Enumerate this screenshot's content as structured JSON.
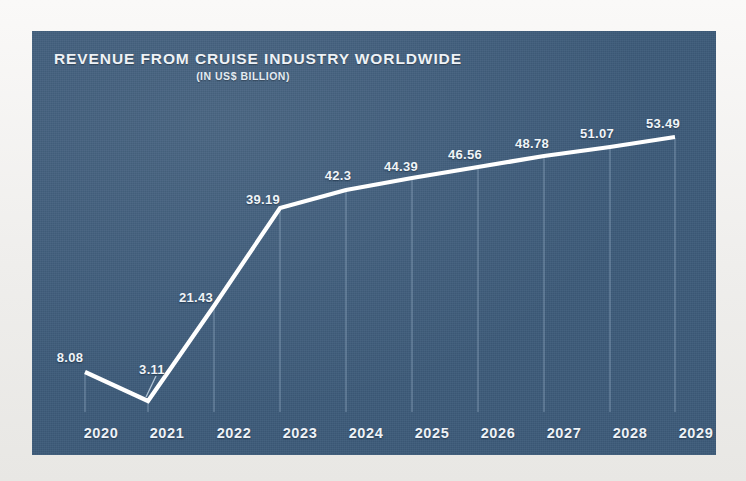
{
  "figure": {
    "background_color": "#f4f3f1",
    "panel_color": "#3c5a79",
    "line_color": "#ffffff",
    "text_color": "#eef2f6",
    "dropline_color": "#9fb6cc"
  },
  "chart_data": {
    "type": "line",
    "title": "REVENUE FROM CRUISE INDUSTRY WORLDWIDE",
    "subtitle": "(IN US$ BILLION)",
    "xlabel": "",
    "ylabel": "",
    "unit": "US$ Billion",
    "grid": false,
    "legend": false,
    "categories": [
      "2020",
      "2021",
      "2022",
      "2023",
      "2024",
      "2025",
      "2026",
      "2027",
      "2028",
      "2029"
    ],
    "values": [
      8.08,
      3.11,
      21.43,
      39.19,
      42.3,
      44.39,
      46.56,
      48.78,
      51.07,
      53.49
    ],
    "point_labels": [
      "8.08",
      "3.11",
      "21.43",
      "39.19",
      "42.3",
      "44.39",
      "46.56",
      "48.78",
      "51.07",
      "53.49"
    ],
    "ylim": [
      0,
      56
    ],
    "series": [
      {
        "name": "Revenue",
        "values": [
          8.08,
          3.11,
          21.43,
          39.19,
          42.3,
          44.39,
          46.56,
          48.78,
          51.07,
          53.49
        ]
      }
    ],
    "points": [
      {
        "x": "2020",
        "value": 8.08,
        "label": "8.08",
        "px": 85,
        "py": 372,
        "lx": 70,
        "ly": 350
      },
      {
        "x": "2021",
        "value": 3.11,
        "label": "3.11",
        "px": 148,
        "py": 401,
        "lx": 152,
        "ly": 362,
        "leader": true
      },
      {
        "x": "2022",
        "value": 21.43,
        "label": "21.43",
        "px": 214,
        "py": 306,
        "lx": 196,
        "ly": 290
      },
      {
        "x": "2023",
        "value": 39.19,
        "label": "39.19",
        "px": 280,
        "py": 208,
        "lx": 263,
        "ly": 192
      },
      {
        "x": "2024",
        "value": 42.3,
        "label": "42.3",
        "px": 346,
        "py": 190,
        "lx": 338,
        "ly": 168
      },
      {
        "x": "2025",
        "value": 44.39,
        "label": "44.39",
        "px": 412,
        "py": 178,
        "lx": 401,
        "ly": 159
      },
      {
        "x": "2026",
        "value": 46.56,
        "label": "46.56",
        "px": 478,
        "py": 167,
        "lx": 465,
        "ly": 147
      },
      {
        "x": "2027",
        "value": 48.78,
        "label": "48.78",
        "px": 544,
        "py": 156,
        "lx": 532,
        "ly": 136
      },
      {
        "x": "2028",
        "value": 51.07,
        "label": "51.07",
        "px": 610,
        "py": 147,
        "lx": 597,
        "ly": 126
      },
      {
        "x": "2029",
        "value": 53.49,
        "label": "53.49",
        "px": 675,
        "py": 137,
        "lx": 663,
        "ly": 116
      }
    ],
    "tick_positions": [
      69,
      135,
      202,
      268,
      334,
      400,
      466,
      532,
      598,
      664
    ],
    "baseline_y": 412
  }
}
